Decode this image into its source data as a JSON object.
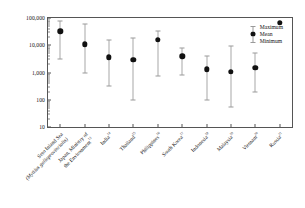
{
  "chart_data": {
    "type": "scatter",
    "title": "",
    "xlabel": "",
    "ylabel": "PCB concentrations (pg/g-wet)",
    "yscale": "log",
    "ylim": [
      10,
      100000
    ],
    "ytick_labels": [
      "100,000",
      "10,000",
      "1,000",
      "100",
      "10"
    ],
    "ytick_values": [
      100000,
      10000,
      1000,
      100,
      10
    ],
    "grid": false,
    "legend_position": "upper-right",
    "legend": [
      {
        "key": "maximum",
        "label": "Maximum"
      },
      {
        "key": "mean",
        "label": "Mean"
      },
      {
        "key": "minimum",
        "label": "Minimum"
      }
    ],
    "categories": [
      "Seto Inland Sea (Mytilus galloprovincialis)",
      "Japan, Ministry of the Environment",
      "India",
      "Thailand",
      "Philippines",
      "South Korea",
      "Indonesia",
      "Malaysia",
      "Vietnam",
      "Russia"
    ],
    "series": [
      {
        "name": "Mean",
        "values": [
          33000,
          11000,
          3600,
          2900,
          16000,
          3900,
          1300,
          1050,
          1450,
          66000
        ]
      },
      {
        "name": "Maximum",
        "values": [
          78000,
          62000,
          15000,
          19000,
          32000,
          7800,
          4100,
          9500,
          5200,
          66000
        ]
      },
      {
        "name": "Minimum",
        "values": [
          3100,
          960,
          310,
          100,
          740,
          780,
          100,
          52,
          185,
          66000
        ]
      }
    ]
  },
  "axis": {
    "x_labels": [
      {
        "lines": [
          {
            "text": "Seto Inland Sea",
            "italic": false
          },
          {
            "text": "(Mytilus galloprovincialis)",
            "italic": true
          }
        ],
        "sup": ""
      },
      {
        "lines": [
          {
            "text": "Japan, Ministry of",
            "italic": false
          },
          {
            "text": "the Environment",
            "italic": false
          }
        ],
        "sup": "13"
      },
      {
        "lines": [
          {
            "text": "India",
            "italic": false
          }
        ],
        "sup": "14"
      },
      {
        "lines": [
          {
            "text": "Thailand",
            "italic": false
          }
        ],
        "sup": "15"
      },
      {
        "lines": [
          {
            "text": "Philippines",
            "italic": false
          }
        ],
        "sup": "16"
      },
      {
        "lines": [
          {
            "text": "South Korea",
            "italic": false
          }
        ],
        "sup": "17"
      },
      {
        "lines": [
          {
            "text": "Indonesia",
            "italic": false
          }
        ],
        "sup": "18"
      },
      {
        "lines": [
          {
            "text": "Malaysia",
            "italic": false
          }
        ],
        "sup": "19"
      },
      {
        "lines": [
          {
            "text": "Vietnam",
            "italic": false
          }
        ],
        "sup": "20"
      },
      {
        "lines": [
          {
            "text": "Russia",
            "italic": false
          }
        ],
        "sup": "21"
      }
    ]
  },
  "colors": {
    "marker": "#111111",
    "whisker": "#a0a0a0",
    "axis": "#555555",
    "background": "#ffffff"
  }
}
